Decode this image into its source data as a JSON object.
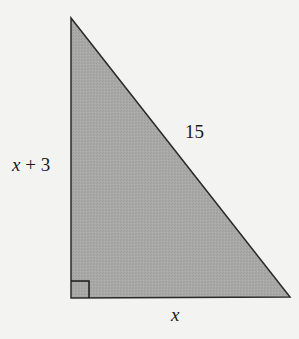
{
  "figure": {
    "type": "right-triangle",
    "colors": {
      "background": "#f3f3f1",
      "fill": "#a8a8a6",
      "stroke": "#2a2a2a",
      "text": "#1a1a1a"
    },
    "vertices": {
      "top": [
        71,
        18
      ],
      "bottom_left": [
        71,
        298
      ],
      "bottom_right": [
        290,
        297
      ]
    },
    "right_angle_marker": {
      "corner": "bottom_left",
      "size": 17
    },
    "labels": {
      "vertical_leg": "x + 3",
      "hypotenuse": "15",
      "horizontal_leg": "x"
    }
  }
}
